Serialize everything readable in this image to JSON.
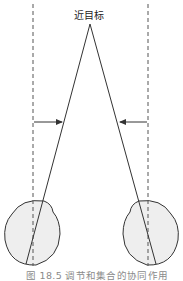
{
  "diagram": {
    "target_label": "近目标",
    "caption": "图 18.5   调节和集合的协同作用",
    "colors": {
      "line": "#333333",
      "dashed": "#555555",
      "eye_fill": "#eeeeee",
      "caption": "#8a8a8a"
    },
    "elements": {
      "left_eye": "left-eye",
      "right_eye": "right-eye",
      "left_visual_axis": "parallel (dashed) line for distant viewing",
      "right_visual_axis": "parallel (dashed) line for distant viewing",
      "left_convergence_arrow": "points inward (right)",
      "right_convergence_arrow": "points inward (left)"
    }
  }
}
